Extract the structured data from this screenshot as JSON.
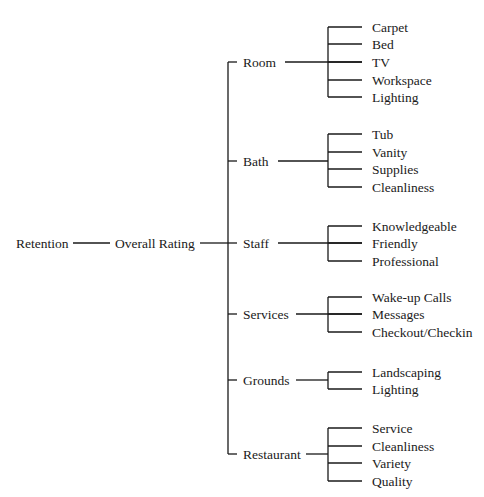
{
  "diagram": {
    "root": {
      "label": "Retention"
    },
    "second": {
      "label": "Overall Rating"
    },
    "categories": [
      {
        "label": "Room",
        "y": 62,
        "line_from": 285,
        "items": [
          {
            "label": "Carpet",
            "y": 27
          },
          {
            "label": "Bed",
            "y": 44
          },
          {
            "label": "TV",
            "y": 62
          },
          {
            "label": "Workspace",
            "y": 80
          },
          {
            "label": "Lighting",
            "y": 97
          }
        ]
      },
      {
        "label": "Bath",
        "y": 161,
        "line_from": 278,
        "items": [
          {
            "label": "Tub",
            "y": 134
          },
          {
            "label": "Vanity",
            "y": 152
          },
          {
            "label": "Supplies",
            "y": 169
          },
          {
            "label": "Cleanliness",
            "y": 187
          }
        ]
      },
      {
        "label": "Staff",
        "y": 243,
        "line_from": 278,
        "items": [
          {
            "label": "Knowledgeable",
            "y": 226
          },
          {
            "label": "Friendly",
            "y": 243
          },
          {
            "label": "Professional",
            "y": 261
          }
        ]
      },
      {
        "label": "Services",
        "y": 314,
        "line_from": 296,
        "items": [
          {
            "label": "Wake-up Calls",
            "y": 297
          },
          {
            "label": "Messages",
            "y": 314
          },
          {
            "label": "Checkout/Checkin",
            "y": 332
          }
        ]
      },
      {
        "label": "Grounds",
        "y": 380,
        "line_from": 296,
        "items": [
          {
            "label": "Landscaping",
            "y": 372
          },
          {
            "label": "Lighting",
            "y": 389
          }
        ]
      },
      {
        "label": "Restaurant",
        "y": 454,
        "line_from": 306,
        "items": [
          {
            "label": "Service",
            "y": 428
          },
          {
            "label": "Cleanliness",
            "y": 446
          },
          {
            "label": "Variety",
            "y": 463
          },
          {
            "label": "Quality",
            "y": 481
          }
        ]
      }
    ]
  }
}
